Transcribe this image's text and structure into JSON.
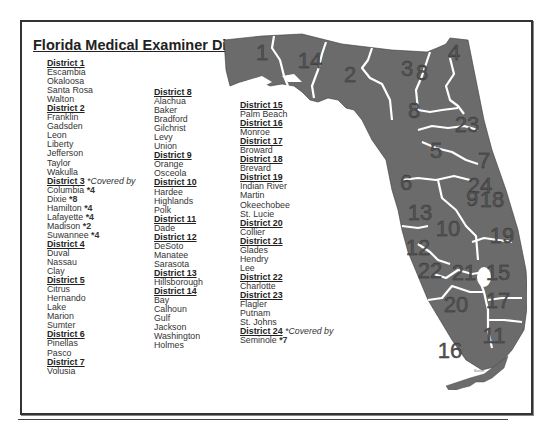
{
  "title": "Florida Medical Examiner Districts",
  "columns": [
    [
      {
        "district": "District 1",
        "counties": [
          "Escambia",
          "Okaloosa",
          "Santa Rosa",
          "Walton"
        ]
      },
      {
        "district": "District 2",
        "counties": [
          "Franklin",
          "Gadsden",
          "Leon",
          "Liberty",
          "Jefferson",
          "Taylor",
          "Wakulla"
        ]
      },
      {
        "district": "District 3",
        "note": "*Covered by",
        "counties": [
          {
            "name": "Columbia",
            "cover": "*4"
          },
          {
            "name": "Dixie",
            "cover": "*8"
          },
          {
            "name": "Hamilton",
            "cover": "*4"
          },
          {
            "name": "Lafayette",
            "cover": "*4"
          },
          {
            "name": "Madison",
            "cover": "*2"
          },
          {
            "name": "Suwannee",
            "cover": "*4"
          }
        ]
      },
      {
        "district": "District 4",
        "counties": [
          "Duval",
          "Nassau",
          "Clay"
        ]
      },
      {
        "district": "District 5",
        "counties": [
          "Citrus",
          "Hernando",
          "Lake",
          "Marion",
          "Sumter"
        ]
      },
      {
        "district": "District 6",
        "counties": [
          "Pinellas",
          "Pasco"
        ]
      },
      {
        "district": "District 7",
        "counties": [
          "Volusia"
        ]
      }
    ],
    [
      {
        "district": "District 8",
        "counties": [
          "Alachua",
          "Baker",
          "Bradford",
          "Gilchrist",
          "Levy",
          "Union"
        ]
      },
      {
        "district": "District 9",
        "counties": [
          "Orange",
          "Osceola"
        ]
      },
      {
        "district": "District 10",
        "counties": [
          "Hardee",
          "Highlands",
          "Polk"
        ]
      },
      {
        "district": "District 11",
        "counties": [
          "Dade"
        ]
      },
      {
        "district": "District 12",
        "counties": [
          "DeSoto",
          "Manatee",
          "Sarasota"
        ]
      },
      {
        "district": "District 13",
        "counties": [
          "Hillsborough"
        ]
      },
      {
        "district": "District 14",
        "counties": [
          "Bay",
          "Calhoun",
          "Gulf",
          "Jackson",
          "Washington",
          "Holmes"
        ]
      }
    ],
    [
      {
        "district": "District 15",
        "counties": [
          "Palm Beach"
        ]
      },
      {
        "district": "District 16",
        "counties": [
          "Monroe"
        ]
      },
      {
        "district": "District 17",
        "counties": [
          "Broward"
        ]
      },
      {
        "district": "District 18",
        "counties": [
          "Brevard"
        ]
      },
      {
        "district": "District 19",
        "counties": [
          "Indian River",
          "Martin",
          "Okeechobee",
          "St. Lucie"
        ]
      },
      {
        "district": "District 20",
        "counties": [
          "Collier"
        ]
      },
      {
        "district": "District 21",
        "counties": [
          "Glades",
          "Hendry",
          "Lee"
        ]
      },
      {
        "district": "District 22",
        "counties": [
          "Charlotte"
        ]
      },
      {
        "district": "District 23",
        "counties": [
          "Flagler",
          "Putnam",
          "St. Johns"
        ]
      },
      {
        "district": "District 24",
        "note": "*Covered by",
        "counties": [
          {
            "name": "Seminole",
            "cover": "*7"
          }
        ]
      }
    ]
  ],
  "map": {
    "fill": "#6b6b6b",
    "border": "#ffffff",
    "labels": [
      {
        "text": "1",
        "x": 40,
        "y": 30
      },
      {
        "text": "14",
        "x": 88,
        "y": 38
      },
      {
        "text": "2",
        "x": 128,
        "y": 52
      },
      {
        "text": "3",
        "x": 185,
        "y": 46
      },
      {
        "text": "8",
        "x": 200,
        "y": 50
      },
      {
        "text": "4",
        "x": 232,
        "y": 30
      },
      {
        "text": "23",
        "x": 245,
        "y": 102
      },
      {
        "text": "8",
        "x": 192,
        "y": 88
      },
      {
        "text": "7",
        "x": 262,
        "y": 138
      },
      {
        "text": "5",
        "x": 214,
        "y": 128
      },
      {
        "text": "24",
        "x": 258,
        "y": 163
      },
      {
        "text": "6",
        "x": 184,
        "y": 160
      },
      {
        "text": "9",
        "x": 250,
        "y": 176
      },
      {
        "text": "18",
        "x": 270,
        "y": 177
      },
      {
        "text": "13",
        "x": 198,
        "y": 190
      },
      {
        "text": "10",
        "x": 226,
        "y": 206
      },
      {
        "text": "19",
        "x": 280,
        "y": 213
      },
      {
        "text": "12",
        "x": 196,
        "y": 225
      },
      {
        "text": "22",
        "x": 208,
        "y": 248
      },
      {
        "text": "21",
        "x": 242,
        "y": 250
      },
      {
        "text": "15",
        "x": 276,
        "y": 250
      },
      {
        "text": "20",
        "x": 234,
        "y": 282
      },
      {
        "text": "17",
        "x": 276,
        "y": 278
      },
      {
        "text": "11",
        "x": 272,
        "y": 313
      },
      {
        "text": "16",
        "x": 228,
        "y": 328
      }
    ],
    "keys_label": "Monroe"
  }
}
